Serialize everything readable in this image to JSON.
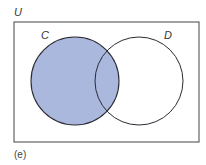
{
  "diagram": {
    "type": "venn",
    "caption": "(e)",
    "universe": {
      "label": "U",
      "rect": {
        "x": 14,
        "y": 22,
        "width": 185,
        "height": 120
      },
      "stroke": "#555555",
      "fill": "#ffffff"
    },
    "sets": [
      {
        "id": "C",
        "label": "C",
        "cx": 75,
        "cy": 81,
        "r": 44,
        "shaded": true,
        "fill": "#a9b8dc",
        "stroke": "#2b2b33",
        "label_pos": {
          "x": 41,
          "y": 39
        }
      },
      {
        "id": "D",
        "label": "D",
        "cx": 139,
        "cy": 81,
        "r": 44,
        "shaded": false,
        "fill": "none",
        "stroke": "#2b2b33",
        "label_pos": {
          "x": 164,
          "y": 39
        }
      }
    ],
    "shaded_region": "C",
    "shade_color": "#a9b8dc",
    "universe_label_pos": {
      "x": 14,
      "y": 16
    },
    "caption_pos": {
      "x": 14,
      "y": 158
    }
  }
}
